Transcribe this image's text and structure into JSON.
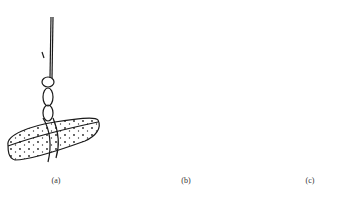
{
  "figure": {
    "panels": [
      {
        "id": "a",
        "caption": "(a)",
        "description": "flat stone hung from a rope with a chain-like loop"
      },
      {
        "id": "b",
        "caption": "(b)",
        "description": "cylindrical stone tied with a hitch knot"
      },
      {
        "id": "c",
        "caption": "(c)",
        "description": "rounded stone hung from a loop"
      }
    ],
    "colors": {
      "ink": "#1a1a1a",
      "background": "#ffffff"
    }
  }
}
